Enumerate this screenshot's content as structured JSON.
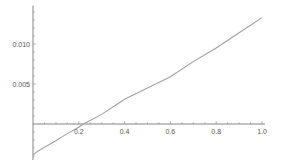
{
  "chart_data": {
    "type": "line",
    "title": "",
    "xlabel": "",
    "ylabel": "",
    "xlim": [
      0,
      1.0
    ],
    "ylim": [
      -0.0045,
      0.0148
    ],
    "grid": false,
    "legend": null,
    "x_ticks": [
      "0.2",
      "0.4",
      "0.6",
      "0.8",
      "1.0"
    ],
    "y_ticks": [
      "0.005",
      "0.010"
    ],
    "series": [
      {
        "name": "curve",
        "color": "#a0a0a0",
        "x": [
          0.0,
          0.02,
          0.05,
          0.1,
          0.15,
          0.2,
          0.22,
          0.3,
          0.4,
          0.5,
          0.6,
          0.7,
          0.8,
          0.9,
          1.0
        ],
        "y": [
          -0.0039,
          -0.0034,
          -0.0029,
          -0.0021,
          -0.0012,
          -0.0004,
          0.0,
          0.0012,
          0.0031,
          0.0045,
          0.0059,
          0.0078,
          0.0095,
          0.0114,
          0.0133
        ]
      }
    ]
  }
}
